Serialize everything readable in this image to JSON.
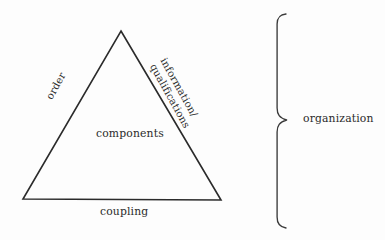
{
  "diagram": {
    "type": "triangle-with-brace",
    "background_color": "#fdfdfd",
    "stroke_color": "#2b2b2b",
    "text_color": "#2b2b2b",
    "triangle": {
      "apex": [
        121,
        31
      ],
      "bottom_left": [
        23,
        199
      ],
      "bottom_right": [
        221,
        200
      ],
      "center_label": "components",
      "left_edge_label": "order",
      "right_edge_label_line1": "information/",
      "right_edge_label_line2": "qualifications",
      "bottom_edge_label": "coupling"
    },
    "brace": {
      "label": "organization",
      "top_y": 14,
      "bottom_y": 228,
      "spine_x": 277,
      "cusp_x": 287,
      "cusp_y": 120,
      "orientation": "right-pointing"
    }
  }
}
